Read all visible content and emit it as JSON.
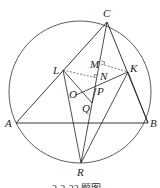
{
  "figure": {
    "caption": "2-2-22 题图",
    "circle": {
      "cx": 80,
      "cy": 92,
      "r": 71
    },
    "points": {
      "A": {
        "label": "A",
        "x": 16,
        "y": 123
      },
      "B": {
        "label": "B",
        "x": 148,
        "y": 123
      },
      "C": {
        "label": "C",
        "x": 107,
        "y": 22
      },
      "L": {
        "label": "L",
        "x": 63,
        "y": 70
      },
      "K": {
        "label": "K",
        "x": 128,
        "y": 72
      },
      "M": {
        "label": "M",
        "x": 101,
        "y": 64
      },
      "N": {
        "label": "N",
        "x": 97,
        "y": 78
      },
      "P": {
        "label": "P",
        "x": 96,
        "y": 86
      },
      "O": {
        "label": "O",
        "x": 78,
        "y": 95
      },
      "Q": {
        "label": "Q",
        "x": 90,
        "y": 105
      },
      "R": {
        "label": "R",
        "x": 81,
        "y": 163
      }
    },
    "colors": {
      "stroke": "#222222",
      "background": "#ffffff"
    }
  }
}
